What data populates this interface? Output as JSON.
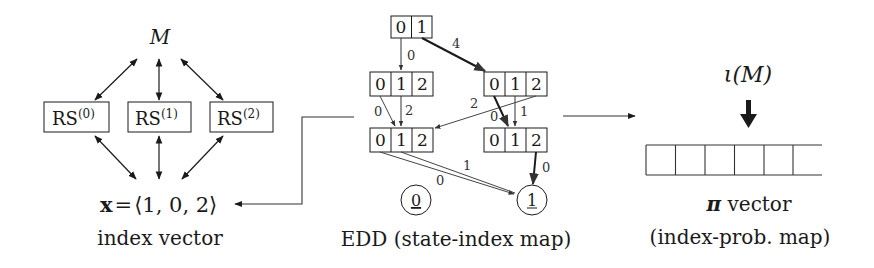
{
  "left": {
    "model_label": "M",
    "rs_boxes": [
      {
        "base": "RS",
        "sup": "(0)"
      },
      {
        "base": "RS",
        "sup": "(1)"
      },
      {
        "base": "RS",
        "sup": "(2)"
      }
    ],
    "index_vector": "x = ⟨1, 0, 2⟩",
    "index_vector_parts": {
      "var": "x",
      "eq": "=",
      "value": "⟨1, 0, 2⟩"
    },
    "caption": "index vector"
  },
  "middle": {
    "caption": "EDD (state-index map)",
    "nodes": [
      {
        "id": "top",
        "cells": [
          "0",
          "1"
        ]
      },
      {
        "id": "mid_left",
        "cells": [
          "0",
          "1",
          "2"
        ]
      },
      {
        "id": "mid_right",
        "cells": [
          "0",
          "1",
          "2"
        ]
      },
      {
        "id": "low_left",
        "cells": [
          "0",
          "1",
          "2"
        ]
      },
      {
        "id": "low_right",
        "cells": [
          "0",
          "1",
          "2"
        ]
      }
    ],
    "terminals": [
      "0",
      "1"
    ],
    "edge_labels": {
      "top_to_midleft": "0",
      "top_to_midright": "4",
      "midleft0_to_lowleft": "0",
      "midleft1_to_lowleft": "2",
      "midright2_to_lowleft": "2",
      "midright0_to_lowright": "0",
      "midright1_to_lowright": "1",
      "lowleft0_to_term1": "0",
      "lowleft1_to_term1": "1",
      "lowright2_to_term1": "0"
    }
  },
  "right": {
    "iota_label": "ι(M)",
    "vector_cells": 6,
    "caption_line1_symbol": "π",
    "caption_line1_text": " vector",
    "caption_line2": "(index-prob. map)"
  }
}
